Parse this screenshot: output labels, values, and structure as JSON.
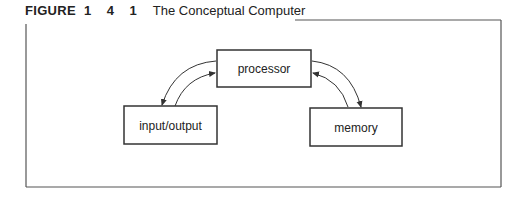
{
  "figure": {
    "label": "FIGURE",
    "number": "1 4 1",
    "title": "The Conceptual Computer"
  },
  "nodes": [
    {
      "id": "processor",
      "label": "processor"
    },
    {
      "id": "input-output",
      "label": "input/output"
    },
    {
      "id": "memory",
      "label": "memory"
    }
  ],
  "edges": [
    {
      "from": "processor",
      "to": "input-output"
    },
    {
      "from": "input-output",
      "to": "processor"
    },
    {
      "from": "processor",
      "to": "memory"
    },
    {
      "from": "memory",
      "to": "processor"
    }
  ],
  "colors": {
    "line": "#333333",
    "text": "#222222",
    "frame": "#555555"
  }
}
